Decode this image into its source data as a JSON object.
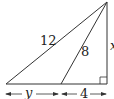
{
  "diagram": {
    "type": "right-triangle-with-cevian",
    "labels": {
      "hypotenuse": "12",
      "cevian": "8",
      "height": "x",
      "left_segment": "y",
      "right_segment": "4"
    },
    "right_angle_marker": true,
    "colors": {
      "stroke": "#333333",
      "background": "#ffffff"
    }
  }
}
